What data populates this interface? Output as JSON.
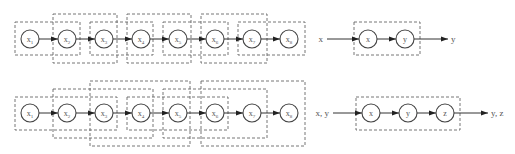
{
  "diagram": {
    "colors": {
      "node_stroke": "#444444",
      "box_stroke": "#666666",
      "edge": "#333333",
      "text": "#555555"
    },
    "top_panel": {
      "row_y": 39,
      "nodes": [
        {
          "id": "x1",
          "base": "x",
          "sub": "1",
          "cx": 30
        },
        {
          "id": "x2",
          "base": "x",
          "sub": "2",
          "cx": 67
        },
        {
          "id": "x3",
          "base": "x",
          "sub": "3",
          "cx": 104
        },
        {
          "id": "x4",
          "base": "x",
          "sub": "4",
          "cx": 141
        },
        {
          "id": "x5",
          "base": "x",
          "sub": "5",
          "cx": 178
        },
        {
          "id": "x6",
          "base": "x",
          "sub": "6",
          "cx": 215
        },
        {
          "id": "x7",
          "base": "x",
          "sub": "7",
          "cx": 252
        },
        {
          "id": "x8",
          "base": "x",
          "sub": "8",
          "cx": 289
        }
      ],
      "windows": [
        {
          "x": 15,
          "y": 22,
          "w": 65,
          "h": 33
        },
        {
          "x": 53,
          "y": 14,
          "w": 64,
          "h": 49
        },
        {
          "x": 90,
          "y": 22,
          "w": 63,
          "h": 33
        },
        {
          "x": 127,
          "y": 14,
          "w": 64,
          "h": 49
        },
        {
          "x": 163,
          "y": 22,
          "w": 65,
          "h": 33
        },
        {
          "x": 201,
          "y": 14,
          "w": 66,
          "h": 49
        },
        {
          "x": 238,
          "y": 22,
          "w": 67,
          "h": 33
        }
      ],
      "block": {
        "input_label": "x",
        "output_label": "y",
        "box": {
          "x": 354,
          "y": 22,
          "w": 66,
          "h": 33
        },
        "nodes": [
          {
            "id": "x",
            "label": "x",
            "cx": 368
          },
          {
            "id": "y",
            "label": "y",
            "cx": 405
          }
        ]
      }
    },
    "bottom_panel": {
      "row_y": 113,
      "nodes": [
        {
          "id": "x1",
          "base": "x",
          "sub": "1",
          "cx": 30
        },
        {
          "id": "x2",
          "base": "x",
          "sub": "2",
          "cx": 67
        },
        {
          "id": "x3",
          "base": "x",
          "sub": "3",
          "cx": 104
        },
        {
          "id": "x4",
          "base": "x",
          "sub": "4",
          "cx": 141
        },
        {
          "id": "x5",
          "base": "x",
          "sub": "5",
          "cx": 178
        },
        {
          "id": "x6",
          "base": "x",
          "sub": "6",
          "cx": 215
        },
        {
          "id": "x7",
          "base": "x",
          "sub": "7",
          "cx": 252
        },
        {
          "id": "x8",
          "base": "x",
          "sub": "8",
          "cx": 289
        }
      ],
      "windows": [
        {
          "x": 15,
          "y": 97,
          "w": 102,
          "h": 33
        },
        {
          "x": 53,
          "y": 89,
          "w": 100,
          "h": 49
        },
        {
          "x": 90,
          "y": 81,
          "w": 100,
          "h": 65
        },
        {
          "x": 127,
          "y": 97,
          "w": 101,
          "h": 33
        },
        {
          "x": 163,
          "y": 89,
          "w": 104,
          "h": 49
        },
        {
          "x": 201,
          "y": 81,
          "w": 104,
          "h": 65
        }
      ],
      "block": {
        "input_label": "x, y",
        "output_label": "y, z",
        "box": {
          "x": 356,
          "y": 97,
          "w": 104,
          "h": 33
        },
        "nodes": [
          {
            "id": "x",
            "label": "x",
            "cx": 371
          },
          {
            "id": "y",
            "label": "y",
            "cx": 408
          },
          {
            "id": "z",
            "label": "z",
            "cx": 445
          }
        ]
      }
    }
  }
}
